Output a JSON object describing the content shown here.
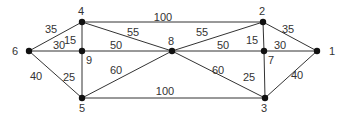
{
  "diagram": {
    "type": "weighted-undirected-graph",
    "nodes": [
      {
        "id": "1",
        "x": 317,
        "y": 51,
        "lx": 329,
        "ly": 55
      },
      {
        "id": "2",
        "x": 263,
        "y": 22,
        "lx": 259,
        "ly": 15
      },
      {
        "id": "3",
        "x": 265,
        "y": 98,
        "lx": 261,
        "ly": 112
      },
      {
        "id": "4",
        "x": 82,
        "y": 22,
        "lx": 78,
        "ly": 15
      },
      {
        "id": "5",
        "x": 82,
        "y": 98,
        "lx": 79,
        "ly": 112
      },
      {
        "id": "6",
        "x": 29,
        "y": 51,
        "lx": 12,
        "ly": 55
      },
      {
        "id": "7",
        "x": 264,
        "y": 51,
        "lx": 268,
        "ly": 64
      },
      {
        "id": "8",
        "x": 172,
        "y": 51,
        "lx": 168,
        "ly": 45
      },
      {
        "id": "9",
        "x": 82,
        "y": 51,
        "lx": 86,
        "ly": 64
      }
    ],
    "edges": [
      {
        "from": "6",
        "to": "4",
        "weight": "35",
        "lx": 51,
        "ly": 33
      },
      {
        "from": "6",
        "to": "9",
        "weight": "30",
        "lx": 59,
        "ly": 49
      },
      {
        "from": "6",
        "to": "5",
        "weight": "40",
        "lx": 36,
        "ly": 80
      },
      {
        "from": "4",
        "to": "9",
        "weight": "15",
        "lx": 70,
        "ly": 44
      },
      {
        "from": "9",
        "to": "5",
        "weight": "25",
        "lx": 69,
        "ly": 81
      },
      {
        "from": "4",
        "to": "2",
        "weight": "100",
        "lx": 163,
        "ly": 21
      },
      {
        "from": "4",
        "to": "8",
        "weight": "55",
        "lx": 133,
        "ly": 36
      },
      {
        "from": "9",
        "to": "8",
        "weight": "50",
        "lx": 116,
        "ly": 49
      },
      {
        "from": "5",
        "to": "8",
        "weight": "60",
        "lx": 116,
        "ly": 74
      },
      {
        "from": "5",
        "to": "3",
        "weight": "100",
        "lx": 165,
        "ly": 95
      },
      {
        "from": "8",
        "to": "2",
        "weight": "55",
        "lx": 202,
        "ly": 36
      },
      {
        "from": "8",
        "to": "7",
        "weight": "50",
        "lx": 223,
        "ly": 49
      },
      {
        "from": "8",
        "to": "3",
        "weight": "60",
        "lx": 218,
        "ly": 74
      },
      {
        "from": "2",
        "to": "7",
        "weight": "15",
        "lx": 252,
        "ly": 44
      },
      {
        "from": "7",
        "to": "3",
        "weight": "25",
        "lx": 249,
        "ly": 81
      },
      {
        "from": "2",
        "to": "1",
        "weight": "35",
        "lx": 288,
        "ly": 33
      },
      {
        "from": "7",
        "to": "1",
        "weight": "30",
        "lx": 280,
        "ly": 49
      },
      {
        "from": "3",
        "to": "1",
        "weight": "40",
        "lx": 297,
        "ly": 79
      }
    ]
  }
}
